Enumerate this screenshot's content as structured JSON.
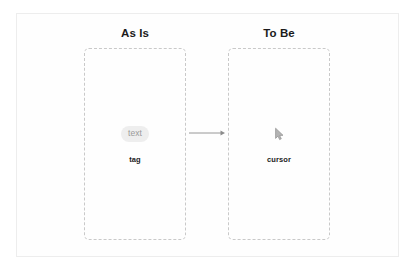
{
  "diagram": {
    "columns": [
      {
        "heading": "As Is",
        "node": {
          "symbol": "text-tag-pill",
          "symbol_text": "text",
          "label": "tag"
        }
      },
      {
        "heading": "To Be",
        "node": {
          "symbol": "cursor-icon",
          "symbol_text": "",
          "label": "cursor"
        }
      }
    ],
    "connector": {
      "name": "arrow-right",
      "direction": "right"
    },
    "colors": {
      "frame_border": "#ededed",
      "dashed_box_border": "#c9c9c9",
      "heading_text": "#1b1b1b",
      "label_text": "#1b1b1b",
      "pill_background": "#eeeeee",
      "pill_text": "#9a9a9a",
      "arrow": "#8c8c8c",
      "background": "#ffffff"
    }
  }
}
